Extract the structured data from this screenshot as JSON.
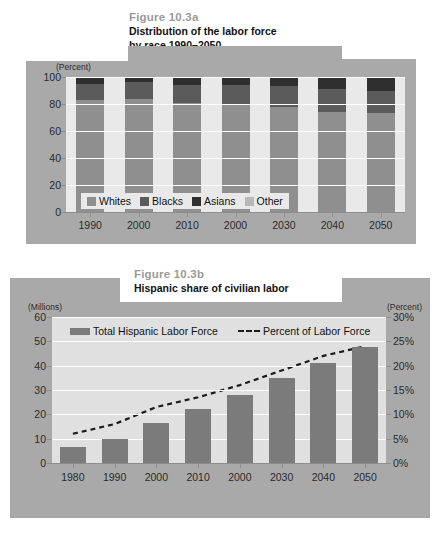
{
  "figure_a": {
    "figure_number": "Figure 10.3a",
    "subtitle_line1": "Distribution of the labor force",
    "subtitle_line2": "by race 1990–2050",
    "unit_label": "(Percent)",
    "legend": [
      {
        "label": "Whites",
        "color": "#8f8f8f"
      },
      {
        "label": "Blacks",
        "color": "#5b5b5b"
      },
      {
        "label": "Asians",
        "color": "#2f2f2f"
      },
      {
        "label": "Other",
        "color": "#b8b8b8"
      }
    ]
  },
  "figure_b": {
    "figure_number": "Figure 10.3b",
    "subtitle_line1": "Hispanic share of civilian labor",
    "unit_label_left": "(Millions)",
    "unit_label_right": "(Percent)",
    "legend": [
      {
        "label": "Total Hispanic Labor Force",
        "type": "bar",
        "color": "#7b7b7b"
      },
      {
        "label": "Percent of Labor Force",
        "type": "dashed-line",
        "color": "#1b1b1b"
      }
    ]
  },
  "chart_data": [
    {
      "type": "bar",
      "id": "figure-10-3a",
      "stacked": true,
      "percent_stacked": true,
      "title": "Distribution of the labor force by race 1990–2050",
      "xlabel": "",
      "ylabel": "(Percent)",
      "ylim": [
        0,
        100
      ],
      "yticks": [
        0,
        20,
        40,
        60,
        80,
        100
      ],
      "ytick_labels": [
        "0",
        "20",
        "40",
        "60",
        "80",
        "100"
      ],
      "grid": true,
      "legend_position": "inside-bottom-left",
      "categories": [
        "1990",
        "2000",
        "2010",
        "2000",
        "2030",
        "2040",
        "2050"
      ],
      "series": [
        {
          "name": "Whites",
          "color": "#8f8f8f",
          "values": [
            83,
            84,
            81,
            80,
            78,
            74,
            73
          ]
        },
        {
          "name": "Blacks",
          "color": "#5b5b5b",
          "values": [
            12,
            12,
            13,
            14,
            15,
            17,
            17
          ]
        },
        {
          "name": "Asians",
          "color": "#2f2f2f",
          "values": [
            4,
            3,
            5,
            5,
            6,
            8,
            9
          ]
        },
        {
          "name": "Other",
          "color": "#b8b8b8",
          "values": [
            1,
            1,
            1,
            1,
            1,
            1,
            1
          ]
        }
      ]
    },
    {
      "type": "bar",
      "id": "figure-10-3b",
      "title": "Hispanic share of civilian labor",
      "xlabel": "",
      "ylabel": "(Millions)",
      "ylim": [
        0,
        60
      ],
      "yticks": [
        0,
        10,
        20,
        30,
        40,
        50,
        60
      ],
      "ytick_labels": [
        "0",
        "10",
        "20",
        "30",
        "40",
        "50",
        "60"
      ],
      "y2label": "(Percent)",
      "y2lim": [
        0,
        30
      ],
      "y2ticks": [
        0,
        5,
        10,
        15,
        20,
        25,
        30
      ],
      "y2tick_labels": [
        "0%",
        "5%",
        "10%",
        "15%",
        "20%",
        "25%",
        "30%"
      ],
      "grid": true,
      "legend_position": "inside-top-left",
      "categories": [
        "1980",
        "1990",
        "2000",
        "2010",
        "2000",
        "2030",
        "2040",
        "2050"
      ],
      "series": [
        {
          "name": "Total Hispanic Labor Force",
          "type": "bar",
          "color": "#7b7b7b",
          "axis": "left",
          "values": [
            6.5,
            10,
            16.5,
            22,
            28,
            35,
            41,
            47.5
          ]
        },
        {
          "name": "Percent of Labor Force",
          "type": "dashed-line",
          "color": "#1b1b1b",
          "axis": "right",
          "values": [
            6.0,
            8.0,
            11.5,
            13.5,
            16.0,
            19.0,
            22.0,
            24.0
          ]
        }
      ]
    }
  ]
}
